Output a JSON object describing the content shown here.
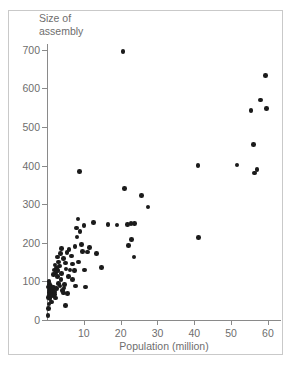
{
  "chart_data": {
    "type": "scatter",
    "title": "",
    "xlabel": "Population (million)",
    "ylabel": "Size of\nassembly",
    "xlim": [
      0,
      63
    ],
    "ylim": [
      0,
      715
    ],
    "grid": false,
    "legend": null,
    "xticks": [
      10,
      20,
      30,
      40,
      50,
      60
    ],
    "yticks": [
      0,
      100,
      200,
      300,
      400,
      500,
      600,
      700
    ],
    "marker": "filled-circle",
    "marker_color": "#1b1b1b",
    "axis_color": "#8a8a8a",
    "label_color": "#6e6e6e",
    "points": [
      [
        0.3,
        12
      ],
      [
        0.4,
        30
      ],
      [
        0.5,
        41
      ],
      [
        0.4,
        58
      ],
      [
        0.6,
        65
      ],
      [
        0.5,
        72
      ],
      [
        0.7,
        78
      ],
      [
        0.4,
        85
      ],
      [
        0.6,
        92
      ],
      [
        0.5,
        100
      ],
      [
        0.8,
        55
      ],
      [
        0.9,
        68
      ],
      [
        1.0,
        75
      ],
      [
        1.1,
        62
      ],
      [
        1.2,
        80
      ],
      [
        1.3,
        47
      ],
      [
        1.0,
        88
      ],
      [
        1.4,
        70
      ],
      [
        1.5,
        77
      ],
      [
        1.6,
        63
      ],
      [
        1.8,
        84
      ],
      [
        2.0,
        66
      ],
      [
        2.1,
        73
      ],
      [
        2.3,
        57
      ],
      [
        2.5,
        81
      ],
      [
        1.7,
        118
      ],
      [
        2.0,
        130
      ],
      [
        2.2,
        142
      ],
      [
        2.4,
        122
      ],
      [
        2.6,
        135
      ],
      [
        2.8,
        112
      ],
      [
        3.0,
        128
      ],
      [
        3.2,
        150
      ],
      [
        2.9,
        163
      ],
      [
        3.4,
        140
      ],
      [
        3.6,
        172
      ],
      [
        3.1,
        95
      ],
      [
        3.5,
        88
      ],
      [
        3.8,
        105
      ],
      [
        4.0,
        120
      ],
      [
        4.2,
        76
      ],
      [
        4.4,
        70
      ],
      [
        4.6,
        83
      ],
      [
        4.0,
        185
      ],
      [
        4.5,
        160
      ],
      [
        5.0,
        148
      ],
      [
        5.2,
        132
      ],
      [
        5.4,
        175
      ],
      [
        4.8,
        92
      ],
      [
        5.6,
        68
      ],
      [
        5.0,
        38
      ],
      [
        5.8,
        112
      ],
      [
        6.2,
        130
      ],
      [
        6.0,
        182
      ],
      [
        6.6,
        166
      ],
      [
        7.0,
        145
      ],
      [
        7.4,
        128
      ],
      [
        7.6,
        191
      ],
      [
        7.0,
        105
      ],
      [
        7.8,
        88
      ],
      [
        8.0,
        238
      ],
      [
        8.2,
        215
      ],
      [
        8.6,
        150
      ],
      [
        9.0,
        230
      ],
      [
        8.4,
        262
      ],
      [
        9.4,
        196
      ],
      [
        9.6,
        178
      ],
      [
        10.0,
        245
      ],
      [
        10.2,
        130
      ],
      [
        10.4,
        85
      ],
      [
        11.0,
        176
      ],
      [
        11.6,
        188
      ],
      [
        12.6,
        252
      ],
      [
        13.4,
        172
      ],
      [
        14.8,
        136
      ],
      [
        8.8,
        385
      ],
      [
        16.6,
        247
      ],
      [
        19.0,
        246
      ],
      [
        20.6,
        695
      ],
      [
        21.0,
        340
      ],
      [
        21.8,
        248
      ],
      [
        22.8,
        250
      ],
      [
        23.8,
        250
      ],
      [
        22.2,
        193
      ],
      [
        23.0,
        208
      ],
      [
        23.6,
        163
      ],
      [
        25.6,
        323
      ],
      [
        27.4,
        293
      ],
      [
        41.0,
        400
      ],
      [
        41.2,
        213
      ],
      [
        51.6,
        402
      ],
      [
        55.4,
        543
      ],
      [
        56.0,
        455
      ],
      [
        56.4,
        381
      ],
      [
        57.0,
        390
      ],
      [
        58.0,
        570
      ],
      [
        59.4,
        633
      ],
      [
        59.6,
        548
      ]
    ]
  },
  "axis_titles": {
    "y": "Size of\nassembly",
    "x": "Population (million)"
  }
}
